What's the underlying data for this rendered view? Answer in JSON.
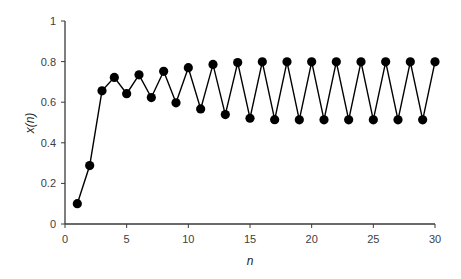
{
  "chart_data": {
    "type": "line",
    "title": "",
    "xlabel": "n",
    "ylabel": "x(n)",
    "xlim": [
      0,
      30
    ],
    "ylim": [
      0,
      1
    ],
    "xticks": [
      0,
      5,
      10,
      15,
      20,
      25,
      30
    ],
    "yticks": [
      0,
      0.2,
      0.4,
      0.6,
      0.8,
      1
    ],
    "xtick_labels": [
      "0",
      "5",
      "10",
      "15",
      "20",
      "25",
      "30"
    ],
    "ytick_labels": [
      "0",
      "0.2",
      "0.4",
      "0.6",
      "0.8",
      "1"
    ],
    "grid": false,
    "legend": null,
    "series": [
      {
        "name": "x(n)",
        "marker": "filled-circle",
        "color": "#000000",
        "x": [
          1,
          2,
          3,
          4,
          5,
          6,
          7,
          8,
          9,
          10,
          11,
          12,
          13,
          14,
          15,
          16,
          17,
          18,
          19,
          20,
          21,
          22,
          23,
          24,
          25,
          26,
          27,
          28,
          29,
          30
        ],
        "values": [
          0.1,
          0.288,
          0.656,
          0.722,
          0.642,
          0.735,
          0.623,
          0.752,
          0.597,
          0.77,
          0.567,
          0.786,
          0.539,
          0.795,
          0.521,
          0.799,
          0.514,
          0.799,
          0.513,
          0.799,
          0.513,
          0.799,
          0.513,
          0.799,
          0.513,
          0.799,
          0.513,
          0.799,
          0.513,
          0.799
        ]
      }
    ]
  }
}
